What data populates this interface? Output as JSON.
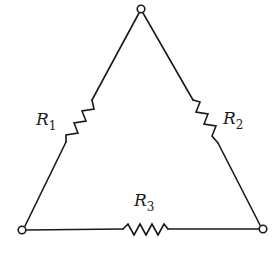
{
  "diagram": {
    "type": "delta resistor network",
    "nodes": [
      {
        "id": "top",
        "x": 141,
        "y": 9
      },
      {
        "id": "bottom-left",
        "x": 22,
        "y": 230
      },
      {
        "id": "bottom-right",
        "x": 263,
        "y": 229
      }
    ],
    "resistors": [
      {
        "id": "R1",
        "label": "R",
        "subscript": "1",
        "between": [
          "top",
          "bottom-left"
        ]
      },
      {
        "id": "R2",
        "label": "R",
        "subscript": "2",
        "between": [
          "top",
          "bottom-right"
        ]
      },
      {
        "id": "R3",
        "label": "R",
        "subscript": "3",
        "between": [
          "bottom-left",
          "bottom-right"
        ]
      }
    ],
    "colors": {
      "line": "#1a1a1a",
      "background": "#ffffff"
    }
  }
}
